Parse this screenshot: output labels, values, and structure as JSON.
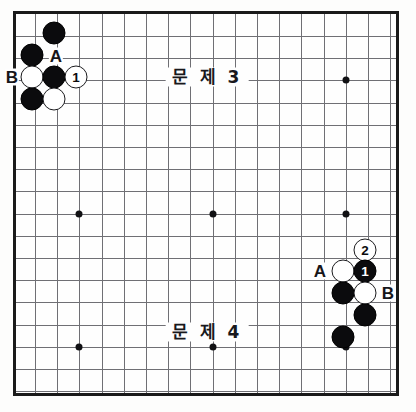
{
  "board": {
    "title": "go-problem-diagram",
    "frame": {
      "left": 13,
      "top": 11,
      "width": 386,
      "height": 385
    },
    "grid": {
      "origin_x": 32,
      "origin_y": 33,
      "spacing": 22.2,
      "cols": 17,
      "rows": 17
    },
    "star_points": [
      {
        "col": 2,
        "row": 2
      },
      {
        "col": 8,
        "row": 2
      },
      {
        "col": 14,
        "row": 2
      },
      {
        "col": 2,
        "row": 8
      },
      {
        "col": 8,
        "row": 8
      },
      {
        "col": 14,
        "row": 8
      },
      {
        "col": 2,
        "row": 14
      },
      {
        "col": 8,
        "row": 14
      },
      {
        "col": 14,
        "row": 14
      }
    ]
  },
  "problems": [
    {
      "id": "problem-3",
      "label": "문 제 3",
      "x": 207,
      "y": 77
    },
    {
      "id": "problem-4",
      "label": "문 제 4",
      "x": 207,
      "y": 332
    }
  ],
  "stones": [
    {
      "id": "tl-black-1",
      "color": "black",
      "x": 54,
      "y": 33,
      "number": ""
    },
    {
      "id": "tl-black-2",
      "color": "black",
      "x": 32,
      "y": 55,
      "number": ""
    },
    {
      "id": "tl-white-1",
      "color": "white",
      "x": 32,
      "y": 77,
      "number": ""
    },
    {
      "id": "tl-black-3",
      "color": "black",
      "x": 54,
      "y": 77,
      "number": ""
    },
    {
      "id": "tl-white-move-1",
      "color": "white",
      "x": 76,
      "y": 77,
      "number": "1"
    },
    {
      "id": "tl-black-4",
      "color": "black",
      "x": 32,
      "y": 99,
      "number": ""
    },
    {
      "id": "tl-white-2",
      "color": "white",
      "x": 54,
      "y": 99,
      "number": ""
    },
    {
      "id": "br-white-move-2",
      "color": "white",
      "x": 365,
      "y": 250,
      "number": "2"
    },
    {
      "id": "br-white-1",
      "color": "white",
      "x": 343,
      "y": 271,
      "number": ""
    },
    {
      "id": "br-black-move-1",
      "color": "black",
      "x": 365,
      "y": 271,
      "number": "1"
    },
    {
      "id": "br-black-1",
      "color": "black",
      "x": 343,
      "y": 293,
      "number": ""
    },
    {
      "id": "br-white-2",
      "color": "white",
      "x": 365,
      "y": 293,
      "number": ""
    },
    {
      "id": "br-black-2",
      "color": "black",
      "x": 365,
      "y": 315,
      "number": ""
    },
    {
      "id": "br-black-3",
      "color": "black",
      "x": 343,
      "y": 337,
      "number": ""
    }
  ],
  "markers": [
    {
      "id": "marker-a-top",
      "label": "A",
      "x": 56,
      "y": 56
    },
    {
      "id": "marker-b-top",
      "label": "B",
      "x": 12,
      "y": 77
    },
    {
      "id": "marker-a-bottom",
      "label": "A",
      "x": 320,
      "y": 271
    },
    {
      "id": "marker-b-bottom",
      "label": "B",
      "x": 388,
      "y": 293
    }
  ],
  "colors": {
    "black_stone": "#0b0b0d",
    "white_stone": "#ffffff",
    "grid_line": "#6f6f74",
    "frame": "#1a1a1a",
    "background": "#fefefe",
    "text": "#16161a"
  }
}
